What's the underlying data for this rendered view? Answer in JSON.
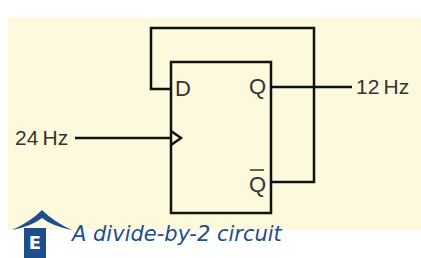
{
  "diagram": {
    "type": "d-flip-flop",
    "pins": {
      "d": "D",
      "q": "Q",
      "q_bar": "Q"
    },
    "input_label": "24 Hz",
    "output_label": "12 Hz"
  },
  "caption": {
    "badge": "E",
    "text": "A divide-by-2 circuit"
  },
  "colors": {
    "panel": "#fdf9dc",
    "accent": "#1f4e8c",
    "line": "#111111"
  }
}
